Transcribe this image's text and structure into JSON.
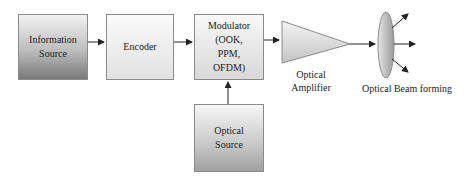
{
  "diagram": {
    "blocks": [
      {
        "id": "information_source",
        "line1": "Information",
        "line2": "Source"
      },
      {
        "id": "encoder",
        "line1": "Encoder"
      },
      {
        "id": "modulator",
        "line1": "Modulator",
        "line2": "(OOK,",
        "line3": "PPM,",
        "line4": "OFDM)"
      },
      {
        "id": "optical_source",
        "line1": "Optical",
        "line2": "Source"
      }
    ],
    "amplifier": {
      "line1": "Optical",
      "line2": "Amplifier"
    },
    "beam_forming": {
      "label": "Optical Beam forming"
    },
    "edges": [
      {
        "from": "Information Source",
        "to": "Encoder"
      },
      {
        "from": "Encoder",
        "to": "Modulator"
      },
      {
        "from": "Optical Source",
        "to": "Modulator"
      },
      {
        "from": "Modulator",
        "to": "Optical Amplifier"
      },
      {
        "from": "Optical Amplifier",
        "to": "Optical Beam forming"
      }
    ],
    "colors": {
      "stroke": "#333333",
      "box_border": "#8a8a8a"
    }
  }
}
